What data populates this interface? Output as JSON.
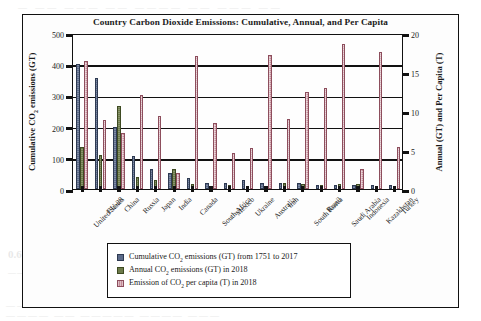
{
  "chart_data": {
    "type": "bar",
    "title": "Country Carbon Dioxide Emissions: Cumulative, Annual, and Per Capita",
    "categories": [
      "United States",
      "EU-28",
      "China",
      "Russia",
      "Japan",
      "India",
      "Canada",
      "South Africa",
      "Mexico",
      "Ukraine",
      "Australia",
      "Iran",
      "South Korea",
      "Brazil",
      "Saudi Arabia",
      "Indonesia",
      "Kazakhstan",
      "Turkey"
    ],
    "series": [
      {
        "name": "Cumulative CO2 emissions (GT) from 1751 to 2017",
        "axis": "left",
        "color": "#5c6b8a",
        "values": [
          400,
          355,
          200,
          105,
          65,
          50,
          35,
          20,
          20,
          28,
          20,
          18,
          18,
          14,
          12,
          12,
          14,
          12
        ]
      },
      {
        "name": "Annual CO2 emissions (GT) in 2018",
        "axis": "right",
        "color": "#6d7b4b",
        "values": [
          5.4,
          4.4,
          10.6,
          1.6,
          1.2,
          2.6,
          0.6,
          0.45,
          0.5,
          0.22,
          0.42,
          0.72,
          0.66,
          0.46,
          0.62,
          0.6,
          0.3,
          0.42
        ]
      },
      {
        "name": "Emission of CO2 per capita (T) in 2018",
        "axis": "right",
        "color": "#c38b97",
        "values": [
          16.4,
          8.8,
          7.2,
          12.0,
          9.4,
          2.0,
          17.0,
          8.4,
          4.6,
          5.2,
          17.2,
          9.0,
          12.4,
          13.0,
          18.6,
          2.6,
          17.6,
          5.4
        ]
      }
    ],
    "axis_left": {
      "label": "Cumulative CO₂ emissions (GT)",
      "min": 0,
      "max": 500,
      "step": 100,
      "ticks": [
        "0",
        "100",
        "200",
        "300",
        "400",
        "500"
      ]
    },
    "axis_right": {
      "label": "Annual (GT) and Per Capita (T)",
      "min": 0,
      "max": 20,
      "step": 5,
      "ticks": [
        "0",
        "5",
        "10",
        "15",
        "20"
      ]
    },
    "xlabel": "",
    "grid": true,
    "legend_position": "bottom-center"
  },
  "legend": {
    "items": [
      {
        "key": "cum",
        "label_html": "Cumulative CO<sub>2</sub> emissions (GT) from 1751 to 2017",
        "swatch": "cumulative-swatch"
      },
      {
        "key": "ann",
        "label_html": "Annual CO<sub>2</sub> emissions (GT) in 2018",
        "swatch": "annual-swatch"
      },
      {
        "key": "cap",
        "label_html": "Emission of CO<sub>2</sub> per capita (T) in 2018",
        "swatch": "percapita-swatch"
      }
    ]
  },
  "axis_label_html": {
    "left": "Cumulative CO<sub>2</sub> emissions (GT)",
    "right": "Annual (GT) and Per Capita (T)"
  },
  "colors": {
    "cumulative": "#5c6b8a",
    "annual": "#6d7b4b",
    "per_capita": "#c38b97",
    "axis": "#111111",
    "background": "#ffffff"
  },
  "page_bleed": {
    "l1": "— —— ——— —— ———— —— ——— ——",
    "l2": "———— ——— ————— ——— ————",
    "l3": "0.6  Carbon Dioxide Emissions",
    "l4": "————— ———— —————— ————",
    "l5": "——— ———— ————— ——— ———— ——",
    "l6": "———— —— ————— ———— ———"
  }
}
